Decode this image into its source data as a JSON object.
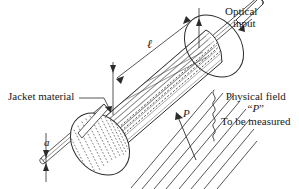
{
  "figure": {
    "background_color": "#ffffff",
    "line_color": "#1a1a1a",
    "text_color": "#1a1a1a"
  },
  "labels": {
    "optical_input_line1": "Optical",
    "optical_input_line2": "input",
    "jacket_material": "Jacket material",
    "physical_field_line1": "Physical field",
    "physical_field_quote_open": "“",
    "physical_field_symbol": "P",
    "physical_field_quote_close": "”",
    "physical_field_line3": "To be measured",
    "length_symbol": "ℓ",
    "radius_symbol": "a",
    "field_arrow_symbol": "P"
  }
}
